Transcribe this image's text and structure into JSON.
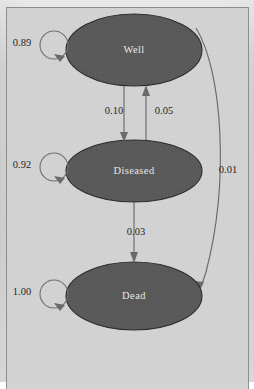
{
  "figure": {
    "background_color": "#d4d4d4",
    "node_fill_color": "#595959",
    "node_text_color": "#e8e8e8",
    "edge_color": "#6a6a6a",
    "label_text_color": "#232323"
  },
  "nodes": [
    {
      "id": "well",
      "label": "Well",
      "cx": 134,
      "cy": 50,
      "rx": 68,
      "ry": 36
    },
    {
      "id": "diseased",
      "label": "Diseased",
      "cx": 134,
      "cy": 171,
      "rx": 68,
      "ry": 31
    },
    {
      "id": "dead",
      "label": "Dead",
      "cx": 134,
      "cy": 296,
      "rx": 68,
      "ry": 34
    }
  ],
  "self_loops": [
    {
      "id": "well-self",
      "from": "well",
      "to": "well",
      "label": "0.89",
      "label_x": 22,
      "label_y": 44,
      "cx": 54,
      "cy": 45,
      "r": 14
    },
    {
      "id": "diseased-self",
      "from": "diseased",
      "to": "diseased",
      "label": "0.92",
      "label_x": 22,
      "label_y": 166,
      "cx": 54,
      "cy": 167,
      "r": 14
    },
    {
      "id": "dead-self",
      "from": "dead",
      "to": "dead",
      "label": "1.00",
      "label_x": 22,
      "label_y": 293,
      "cx": 54,
      "cy": 294,
      "r": 14
    }
  ],
  "edges": [
    {
      "id": "well-to-diseased",
      "from": "well",
      "to": "diseased",
      "label": "0.10",
      "label_x": 116,
      "label_y": 112,
      "direction": "down",
      "x": 124
    },
    {
      "id": "diseased-to-well",
      "from": "diseased",
      "to": "well",
      "label": "0.05",
      "label_x": 163,
      "label_y": 112,
      "direction": "up",
      "x": 146
    },
    {
      "id": "diseased-to-dead",
      "from": "diseased",
      "to": "dead",
      "label": "0.03",
      "label_x": 134,
      "label_y": 233,
      "direction": "down",
      "x": 134
    },
    {
      "id": "well-to-dead",
      "from": "well",
      "to": "dead",
      "label": "0.01",
      "label_x": 223,
      "label_y": 171,
      "direction": "curve-right"
    }
  ],
  "transition_matrix": {
    "states": [
      "Well",
      "Diseased",
      "Dead"
    ],
    "rows": [
      {
        "from": "Well",
        "to_well": "0.89",
        "to_diseased": "0.10",
        "to_dead": "0.01"
      },
      {
        "from": "Diseased",
        "to_well": "0.05",
        "to_diseased": "0.92",
        "to_dead": "0.03"
      },
      {
        "from": "Dead",
        "to_well": "0.00",
        "to_diseased": "0.00",
        "to_dead": "1.00"
      }
    ]
  }
}
